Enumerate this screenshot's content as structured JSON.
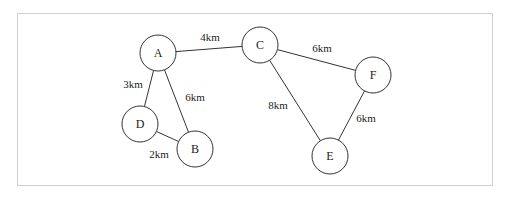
{
  "diagram": {
    "type": "weighted-graph",
    "nodes": [
      {
        "id": "A",
        "label": "A",
        "x": 158,
        "y": 53
      },
      {
        "id": "B",
        "label": "B",
        "x": 195,
        "y": 149
      },
      {
        "id": "C",
        "label": "C",
        "x": 260,
        "y": 45
      },
      {
        "id": "D",
        "label": "D",
        "x": 140,
        "y": 124
      },
      {
        "id": "E",
        "label": "E",
        "x": 330,
        "y": 156
      },
      {
        "id": "F",
        "label": "F",
        "x": 373,
        "y": 75
      }
    ],
    "edges": [
      {
        "from": "A",
        "to": "C",
        "label": "4km",
        "lx": 210,
        "ly": 37
      },
      {
        "from": "A",
        "to": "D",
        "label": "3km",
        "lx": 133,
        "ly": 84
      },
      {
        "from": "A",
        "to": "B",
        "label": "6km",
        "lx": 195,
        "ly": 97
      },
      {
        "from": "D",
        "to": "B",
        "label": "2km",
        "lx": 159,
        "ly": 154
      },
      {
        "from": "C",
        "to": "F",
        "label": "6km",
        "lx": 322,
        "ly": 48
      },
      {
        "from": "C",
        "to": "E",
        "label": "8km",
        "lx": 278,
        "ly": 105
      },
      {
        "from": "F",
        "to": "E",
        "label": "6km",
        "lx": 366,
        "ly": 118
      }
    ]
  }
}
